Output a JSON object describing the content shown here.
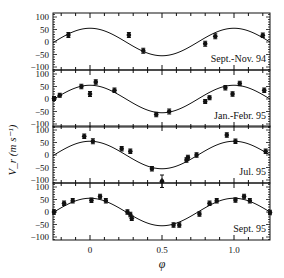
{
  "figure": {
    "ylabel": "V_r (m s⁻¹)",
    "xlabel": "φ",
    "x_tick_labels": [
      "0",
      "0.5",
      "1.0"
    ],
    "y_tick_labels": [
      "100",
      "50",
      "0",
      "−50",
      "−100"
    ]
  },
  "chart_data": {
    "type": "scatter",
    "title": "",
    "xlabel": "φ",
    "ylabel": "V_r (m s^-1)",
    "xlim": [
      -0.26,
      1.25
    ],
    "ylim": [
      -120,
      110
    ],
    "x_ticks": [
      0,
      0.5,
      1.0
    ],
    "y_ticks": [
      100,
      50,
      0,
      -50,
      -100
    ],
    "grid": false,
    "legend": null,
    "model": "sinusoid, amplitude ~55 m/s, peak at φ≈0 and φ≈1, trough at φ≈0.5",
    "panels": [
      {
        "label": "Sept.-Nov. 94",
        "fit": {
          "amplitude": 55,
          "offset": 0
        },
        "points": [
          {
            "x": -0.15,
            "y": 28,
            "err": 10
          },
          {
            "x": 0.27,
            "y": 28,
            "err": 10
          },
          {
            "x": 0.37,
            "y": -35,
            "err": 10
          },
          {
            "x": 0.8,
            "y": -7,
            "err": 10
          },
          {
            "x": 0.87,
            "y": 23,
            "err": 10
          },
          {
            "x": 1.2,
            "y": 27,
            "err": 9
          }
        ]
      },
      {
        "label": "Jan.-Febr. 95",
        "fit": {
          "amplitude": 55,
          "offset": 0
        },
        "points": [
          {
            "x": -0.25,
            "y": 2,
            "err": 8
          },
          {
            "x": -0.21,
            "y": 15,
            "err": 8
          },
          {
            "x": -0.06,
            "y": 50,
            "err": 9
          },
          {
            "x": 0.0,
            "y": 20,
            "err": 10
          },
          {
            "x": 0.04,
            "y": 68,
            "err": 9
          },
          {
            "x": 0.17,
            "y": 35,
            "err": 9
          },
          {
            "x": 0.46,
            "y": -62,
            "err": 9
          },
          {
            "x": 0.55,
            "y": -50,
            "err": 10
          },
          {
            "x": 0.8,
            "y": -10,
            "err": 8
          },
          {
            "x": 0.83,
            "y": 5,
            "err": 8
          },
          {
            "x": 0.94,
            "y": 45,
            "err": 9
          },
          {
            "x": 0.99,
            "y": 20,
            "err": 9
          },
          {
            "x": 1.04,
            "y": 62,
            "err": 9
          },
          {
            "x": 1.21,
            "y": 35,
            "err": 9
          }
        ]
      },
      {
        "label": "Jul. 95",
        "fit": {
          "amplitude": 55,
          "offset": 0
        },
        "points": [
          {
            "x": -0.04,
            "y": 75,
            "err": 9
          },
          {
            "x": 0.02,
            "y": 55,
            "err": 10
          },
          {
            "x": 0.22,
            "y": 25,
            "err": 9
          },
          {
            "x": 0.28,
            "y": 15,
            "err": 9
          },
          {
            "x": 0.43,
            "y": -55,
            "err": 9
          },
          {
            "x": 0.5,
            "y": -105,
            "err": 25
          },
          {
            "x": 0.67,
            "y": -20,
            "err": 9
          },
          {
            "x": 0.68,
            "y": -10,
            "err": 9
          },
          {
            "x": 0.74,
            "y": 0,
            "err": 9
          },
          {
            "x": 0.95,
            "y": 80,
            "err": 9
          },
          {
            "x": 1.01,
            "y": 55,
            "err": 9
          },
          {
            "x": 1.22,
            "y": 15,
            "err": 9
          }
        ]
      },
      {
        "label": "Sept. 95",
        "fit": {
          "amplitude": 55,
          "offset": 0
        },
        "points": [
          {
            "x": -0.25,
            "y": 0,
            "err": 9
          },
          {
            "x": -0.18,
            "y": 35,
            "err": 9
          },
          {
            "x": -0.12,
            "y": 45,
            "err": 9
          },
          {
            "x": 0.01,
            "y": 47,
            "err": 9
          },
          {
            "x": 0.07,
            "y": 62,
            "err": 9
          },
          {
            "x": 0.11,
            "y": 45,
            "err": 9
          },
          {
            "x": 0.26,
            "y": 0,
            "err": 9
          },
          {
            "x": 0.28,
            "y": -10,
            "err": 9
          },
          {
            "x": 0.29,
            "y": -25,
            "err": 9
          },
          {
            "x": 0.58,
            "y": -52,
            "err": 9
          },
          {
            "x": 0.62,
            "y": -52,
            "err": 9
          },
          {
            "x": 0.76,
            "y": -8,
            "err": 9
          },
          {
            "x": 0.83,
            "y": 35,
            "err": 9
          },
          {
            "x": 0.88,
            "y": 45,
            "err": 9
          },
          {
            "x": 1.01,
            "y": 48,
            "err": 9
          },
          {
            "x": 1.07,
            "y": 62,
            "err": 9
          },
          {
            "x": 1.11,
            "y": 45,
            "err": 9
          },
          {
            "x": 1.25,
            "y": -2,
            "err": 9
          }
        ]
      }
    ]
  }
}
